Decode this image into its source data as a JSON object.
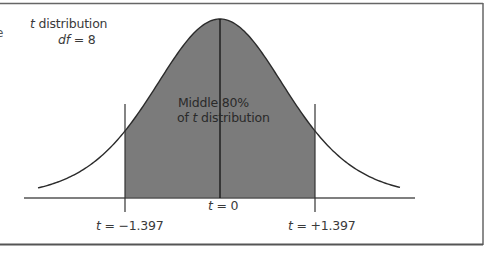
{
  "chart_data": {
    "type": "area",
    "title": "t distribution",
    "subtitle": "df = 8",
    "distribution": "t",
    "df": 8,
    "shaded_region": {
      "label_line1": "Middle 80%",
      "label_line2_prefix": "of ",
      "label_line2_var": "t",
      "label_line2_suffix": " distribution",
      "proportion": 0.8,
      "from": -1.397,
      "to": 1.397
    },
    "tick_labels": [
      {
        "var": "t",
        "text": " = −1.397",
        "value": -1.397
      },
      {
        "var": "t",
        "text": " = 0",
        "value": 0
      },
      {
        "var": "t",
        "text": " = +1.397",
        "value": 1.397
      }
    ],
    "xlabel": "",
    "ylabel": "",
    "grid": false,
    "colors": {
      "shade": "#7b7b7b",
      "curve": "#2b2b2b",
      "axis": "#555555",
      "frame": "#666666"
    }
  },
  "legend": {
    "var": "t",
    "line1_suffix": " distribution",
    "df_var": "df",
    "df_suffix": " = 8"
  },
  "edge_fragment": "e"
}
